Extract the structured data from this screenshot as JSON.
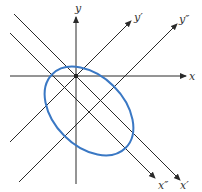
{
  "diagram": {
    "colors": {
      "axis": "#2a2a2a",
      "ellipse": "#3a78c4",
      "label": "#333333"
    },
    "axes": [
      {
        "name": "x",
        "label": "x"
      },
      {
        "name": "y",
        "label": "y"
      },
      {
        "name": "x-prime",
        "label": "x′"
      },
      {
        "name": "y-prime",
        "label": "y′"
      },
      {
        "name": "x-double-prime",
        "label": "x″"
      },
      {
        "name": "y-double-prime",
        "label": "y″"
      }
    ],
    "origin_marker": "dot at intersection of x, y, x′, y′",
    "ellipse": {
      "center_on": "intersection of x″ and y″",
      "major_axis_along": "x″",
      "minor_axis_along": "y″"
    }
  }
}
